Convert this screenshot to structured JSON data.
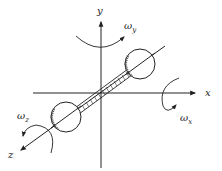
{
  "diagram": {
    "title": "",
    "axes": {
      "x": {
        "label": "x"
      },
      "y": {
        "label": "y"
      },
      "z": {
        "label": "z"
      }
    },
    "rotations": {
      "x": {
        "symbol": "ω",
        "subscript": "x"
      },
      "y": {
        "symbol": "ω",
        "subscript": "y"
      },
      "z": {
        "symbol": "ω",
        "subscript": "z"
      }
    },
    "colors": {
      "stroke": "#222222",
      "background": "#ffffff"
    }
  }
}
